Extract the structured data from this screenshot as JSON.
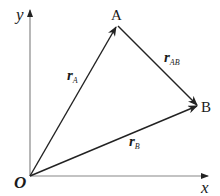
{
  "diagram": {
    "axes": {
      "x_label": "x",
      "y_label": "y",
      "origin_label": "O"
    },
    "points": {
      "A": "A",
      "B": "B"
    },
    "vectors": {
      "rA": {
        "main": "r",
        "sub": "A"
      },
      "rB": {
        "main": "r",
        "sub": "B"
      },
      "rAB": {
        "main": "r",
        "sub": "AB"
      }
    },
    "colors": {
      "axis": "#777777",
      "vector": "#222222",
      "text": "#1a1a1a"
    }
  }
}
